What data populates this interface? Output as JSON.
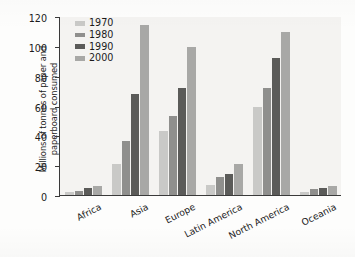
{
  "chart_data": {
    "type": "bar",
    "title": "",
    "xlabel": "",
    "ylabel": "Millions of tonnes of paper and\npaperboard consumed",
    "categories": [
      "Africa",
      "Asia",
      "Europe",
      "Latin America",
      "North America",
      "Oceania"
    ],
    "series": [
      {
        "name": "1970",
        "color": "#c9c9c7",
        "values": [
          2,
          21,
          43,
          7,
          59,
          2
        ]
      },
      {
        "name": "1980",
        "color": "#8f8f8d",
        "values": [
          3,
          36,
          53,
          12,
          72,
          4
        ]
      },
      {
        "name": "1990",
        "color": "#5b5b59",
        "values": [
          5,
          68,
          72,
          14,
          92,
          5
        ]
      },
      {
        "name": "2000",
        "color": "#a8a8a6",
        "values": [
          6,
          114,
          99,
          21,
          109,
          6
        ]
      }
    ],
    "ylim": [
      0,
      120
    ],
    "yticks": [
      0,
      20,
      40,
      60,
      80,
      100,
      120
    ],
    "ytick_labels": [
      "0",
      "20",
      "40",
      "60",
      "80",
      "100",
      "120"
    ],
    "grid": false,
    "legend_position": "top-left-inside",
    "legend_entries": [
      "1970",
      "1980",
      "1990",
      "2000"
    ],
    "plot_background": "#f4f3f1",
    "axis_color": "#3a3a3a"
  }
}
